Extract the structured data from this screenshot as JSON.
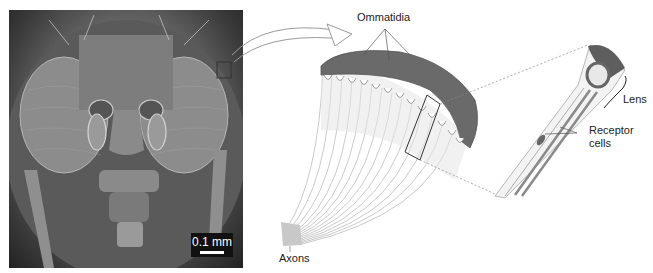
{
  "figure": {
    "photo": {
      "subject": "scanning electron micrograph of fly head",
      "scale_bar_label": "0.1 mm"
    },
    "labels": {
      "ommatidia": "Ommatidia",
      "axons": "Axons",
      "lens": "Lens",
      "receptor_line1": "Receptor",
      "receptor_line2": "cells"
    },
    "colors": {
      "background": "#ffffff",
      "eye_surface": "#6a6a6a",
      "fiber": "#bdbdbd",
      "label_text": "#222222"
    }
  }
}
